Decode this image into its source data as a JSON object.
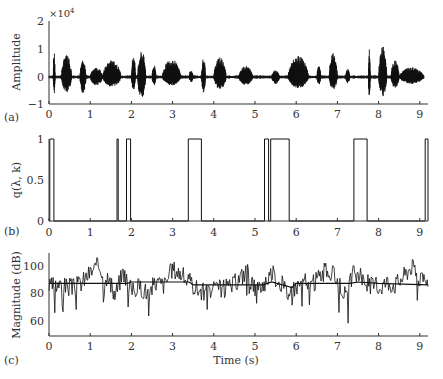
{
  "chart_data": [
    {
      "panel": "(a)",
      "type": "line",
      "title": "",
      "xlabel": "",
      "ylabel": "Amplitude",
      "y_multiplier": "×10^4",
      "xlim": [
        0,
        9.2
      ],
      "ylim": [
        -1,
        2
      ],
      "xticks": [
        0,
        1,
        2,
        3,
        4,
        5,
        6,
        7,
        8,
        9
      ],
      "yticks": [
        -1,
        0,
        1,
        2
      ],
      "grid": false,
      "description": "Speech waveform (units ×10^4); bursts of activity separated by near-silence",
      "envelope_bursts": [
        {
          "start": 0.1,
          "end": 0.15,
          "peak": 0.9,
          "trough": -0.6
        },
        {
          "start": 0.3,
          "end": 0.55,
          "peak": 0.8,
          "trough": -0.55
        },
        {
          "start": 0.75,
          "end": 0.9,
          "peak": 0.6,
          "trough": -0.6
        },
        {
          "start": 1.0,
          "end": 1.3,
          "peak": 0.35,
          "trough": -0.3
        },
        {
          "start": 1.3,
          "end": 1.75,
          "peak": 0.6,
          "trough": -0.35
        },
        {
          "start": 2.0,
          "end": 2.1,
          "peak": 0.8,
          "trough": -0.5
        },
        {
          "start": 2.15,
          "end": 2.35,
          "peak": 0.95,
          "trough": -0.8
        },
        {
          "start": 2.5,
          "end": 2.6,
          "peak": 0.45,
          "trough": -0.3
        },
        {
          "start": 2.75,
          "end": 3.2,
          "peak": 0.65,
          "trough": -0.3
        },
        {
          "start": 3.4,
          "end": 3.5,
          "peak": 0.25,
          "trough": -0.2
        },
        {
          "start": 3.7,
          "end": 3.8,
          "peak": 0.7,
          "trough": -0.55
        },
        {
          "start": 4.0,
          "end": 4.3,
          "peak": 0.7,
          "trough": -0.45
        },
        {
          "start": 4.6,
          "end": 4.95,
          "peak": 0.4,
          "trough": -0.3
        },
        {
          "start": 5.4,
          "end": 5.6,
          "peak": 0.25,
          "trough": -0.25
        },
        {
          "start": 5.8,
          "end": 6.3,
          "peak": 0.75,
          "trough": -0.4
        },
        {
          "start": 6.5,
          "end": 6.6,
          "peak": 0.4,
          "trough": -0.3
        },
        {
          "start": 6.8,
          "end": 7.0,
          "peak": 0.85,
          "trough": -0.45
        },
        {
          "start": 7.2,
          "end": 7.3,
          "peak": 0.3,
          "trough": -0.25
        },
        {
          "start": 7.75,
          "end": 7.8,
          "peak": 1.0,
          "trough": -0.7
        },
        {
          "start": 8.0,
          "end": 8.2,
          "peak": 1.1,
          "trough": -0.7
        },
        {
          "start": 8.3,
          "end": 8.5,
          "peak": 0.6,
          "trough": -0.4
        },
        {
          "start": 8.5,
          "end": 9.1,
          "peak": 0.35,
          "trough": -0.25
        }
      ]
    },
    {
      "panel": "(b)",
      "type": "line",
      "title": "",
      "xlabel": "",
      "ylabel": "q(λ, k)",
      "xlim": [
        0,
        9.2
      ],
      "ylim": [
        0,
        1
      ],
      "xticks": [
        0,
        1,
        2,
        3,
        4,
        5,
        6,
        7,
        8,
        9
      ],
      "yticks": [
        0,
        0.5,
        1
      ],
      "grid": false,
      "description": "Binary speech-presence indicator; value 1 during these intervals, 0 otherwise",
      "pulses": [
        {
          "start": 0.02,
          "end": 0.12,
          "value": 1
        },
        {
          "start": 1.65,
          "end": 1.68,
          "value": 1
        },
        {
          "start": 1.88,
          "end": 1.98,
          "value": 1
        },
        {
          "start": 3.38,
          "end": 3.7,
          "value": 1
        },
        {
          "start": 5.23,
          "end": 5.33,
          "value": 1
        },
        {
          "start": 5.38,
          "end": 5.83,
          "value": 1
        },
        {
          "start": 7.4,
          "end": 7.72,
          "value": 1
        },
        {
          "start": 9.13,
          "end": 9.2,
          "value": 1
        }
      ]
    },
    {
      "panel": "(c)",
      "type": "line",
      "title": "",
      "xlabel": "Time (s)",
      "ylabel": "Magnitude (dB)",
      "xlim": [
        0,
        9.2
      ],
      "ylim": [
        50,
        110
      ],
      "xticks": [
        0,
        1,
        2,
        3,
        4,
        5,
        6,
        7,
        8,
        9
      ],
      "yticks": [
        60,
        80,
        100
      ],
      "grid": false,
      "series": [
        {
          "name": "noisy magnitude",
          "x": [
            0,
            0.2,
            0.4,
            0.6,
            0.8,
            1.0,
            1.2,
            1.4,
            1.6,
            1.8,
            2.0,
            2.2,
            2.4,
            2.6,
            2.8,
            3.0,
            3.2,
            3.4,
            3.6,
            3.8,
            4.0,
            4.2,
            4.4,
            4.6,
            4.8,
            5.0,
            5.2,
            5.4,
            5.6,
            5.8,
            6.0,
            6.2,
            6.4,
            6.6,
            6.8,
            7.0,
            7.2,
            7.4,
            7.6,
            7.8,
            8.0,
            8.2,
            8.4,
            8.6,
            8.8,
            9.0,
            9.2
          ],
          "y": [
            84,
            86,
            85,
            84,
            88,
            95,
            100,
            92,
            78,
            96,
            82,
            85,
            80,
            88,
            86,
            98,
            94,
            88,
            83,
            80,
            82,
            84,
            84,
            90,
            96,
            82,
            86,
            95,
            88,
            80,
            85,
            88,
            86,
            94,
            96,
            90,
            78,
            95,
            90,
            86,
            84,
            88,
            86,
            92,
            100,
            90,
            84
          ]
        },
        {
          "name": "noise estimate",
          "x": [
            0,
            1.9,
            2.0,
            3.4,
            3.5,
            4.6,
            5.2,
            5.4,
            5.9,
            6.0,
            7.3,
            7.5,
            8.0,
            9.2
          ],
          "y": [
            87,
            87,
            88,
            88,
            86,
            86,
            86,
            88,
            84,
            87,
            87,
            88,
            87,
            86
          ]
        }
      ],
      "description": "Noisy spectral magnitude (jagged) with smooth noise-level estimate near 86–88 dB"
    }
  ],
  "panels": {
    "a": {
      "tag": "(a)",
      "ylabel": "Amplitude",
      "multiplier_base": "×10",
      "multiplier_exp": "4",
      "yticks": [
        "2",
        "1",
        "0",
        "−1"
      ]
    },
    "b": {
      "tag": "(b)",
      "ylabel": "q(λ, k)",
      "yticks": [
        "1",
        "0.5",
        "0"
      ]
    },
    "c": {
      "tag": "(c)",
      "ylabel": "Magnitude (dB)",
      "yticks": [
        "100",
        "80",
        "60"
      ],
      "xlabel": "Time (s)"
    }
  },
  "xticks": [
    "0",
    "1",
    "2",
    "3",
    "4",
    "5",
    "6",
    "7",
    "8",
    "9"
  ]
}
